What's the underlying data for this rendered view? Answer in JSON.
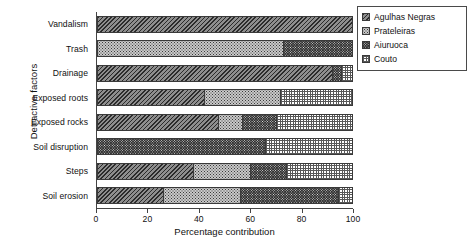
{
  "chart_data": {
    "type": "bar",
    "orientation": "horizontal",
    "stacked": true,
    "title": "",
    "xlabel": "Percentage contribution",
    "ylabel": "Detractive factors",
    "xlim": [
      0,
      100
    ],
    "xticks": [
      0,
      20,
      40,
      60,
      80,
      100
    ],
    "grid": false,
    "legend_position": "top-right",
    "categories": [
      "Vandalism",
      "Trash",
      "Drainage",
      "Exposed roots",
      "Exposed rocks",
      "Soil disruption",
      "Steps",
      "Soil erosion"
    ],
    "series": [
      {
        "name": "Agulhas Negras",
        "pattern": "diagonal-hatch",
        "values": [
          100,
          0,
          93,
          42,
          48,
          0,
          38,
          26
        ]
      },
      {
        "name": "Prateleiras",
        "pattern": "light-dots",
        "values": [
          0,
          73,
          0,
          30,
          9,
          0,
          22,
          30
        ]
      },
      {
        "name": "Aiuruoca",
        "pattern": "dark-dense",
        "values": [
          0,
          27,
          3,
          0,
          13,
          66,
          14,
          39
        ]
      },
      {
        "name": "Couto",
        "pattern": "white-checker",
        "values": [
          0,
          0,
          4,
          28,
          30,
          34,
          26,
          5
        ]
      }
    ]
  },
  "legend": {
    "items": [
      {
        "label": "Agulhas Negras"
      },
      {
        "label": "Prateleiras"
      },
      {
        "label": "Aiuruoca"
      },
      {
        "label": "Couto"
      }
    ]
  },
  "caption": {
    "text": ""
  }
}
